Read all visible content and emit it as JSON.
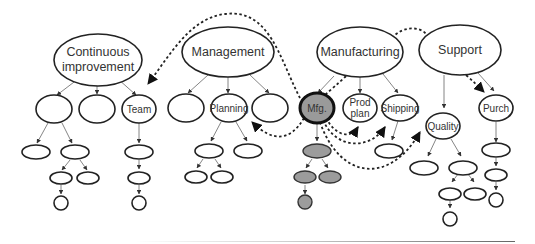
{
  "diagram": {
    "type": "organizational hierarchy with cross-links",
    "top_nodes": [
      {
        "id": "ci",
        "label_line1": "Continuous",
        "label_line2": "improvement"
      },
      {
        "id": "mgmt",
        "label": "Management"
      },
      {
        "id": "manu",
        "label": "Manufacturing"
      },
      {
        "id": "supp",
        "label": "Support"
      }
    ],
    "labels": {
      "team": "Team",
      "planning": "Planning",
      "mfg": "Mfg.",
      "prodplan_line1": "Prod",
      "prodplan_line2": "plan",
      "shipping": "Shipping",
      "quality": "Quality",
      "purch": "Purch"
    },
    "colors": {
      "stroke": "#222222",
      "shaded_fill": "#9c9c9c",
      "background": "#ffffff",
      "edge": "#777777"
    },
    "dashed_links": [
      {
        "from": "Mfg.",
        "to": "Team"
      },
      {
        "from": "Mfg.",
        "to": "Planning"
      },
      {
        "from": "Mfg.",
        "to": "Prod plan"
      },
      {
        "from": "Mfg.",
        "to": "Shipping"
      },
      {
        "from": "Mfg.",
        "to": "Quality"
      },
      {
        "from": "Manufacturing",
        "to": "Support"
      },
      {
        "from": "Support",
        "to": "Purch"
      },
      {
        "from": "Manufacturing",
        "to": "Mfg."
      }
    ]
  }
}
